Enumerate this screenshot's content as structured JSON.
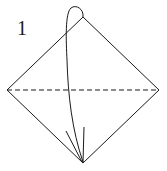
{
  "diagram": {
    "step_number": "1",
    "type": "origami-fold-step",
    "instruction": "Valley fold top corner down to bottom corner along dashed line",
    "shape": "square-on-diamond",
    "colors": {
      "stroke": "#1a1a1a",
      "background": "#ffffff"
    },
    "elements": [
      {
        "name": "diamond-outline",
        "kind": "polygon",
        "points": [
          [
            83,
            17
          ],
          [
            159,
            90
          ],
          [
            83,
            163
          ],
          [
            7,
            90
          ]
        ]
      },
      {
        "name": "valley-fold-line",
        "kind": "dashed-line",
        "from": [
          7,
          90
        ],
        "to": [
          159,
          90
        ]
      },
      {
        "name": "fold-arrow",
        "kind": "curved-arrow",
        "from": [
          83,
          17
        ],
        "to": [
          83,
          163
        ]
      }
    ]
  }
}
